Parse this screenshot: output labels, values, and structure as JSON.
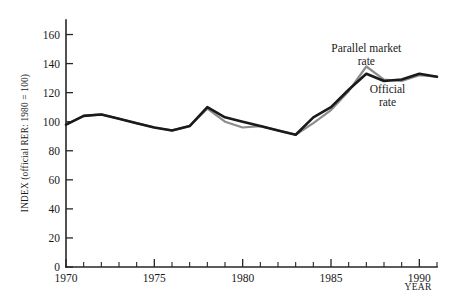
{
  "chart_data": {
    "type": "line",
    "title": "",
    "xlabel": "YEAR",
    "ylabel": "INDEX (official RER: 1980 = 100)",
    "xlim": [
      1970,
      1991
    ],
    "ylim": [
      0,
      170
    ],
    "x_ticks_major": [
      1970,
      1975,
      1980,
      1985,
      1990
    ],
    "x_tick_labels": [
      "1970",
      "1975",
      "1980",
      "1985",
      "1990"
    ],
    "y_ticks": [
      0,
      20,
      40,
      60,
      80,
      100,
      120,
      140,
      160
    ],
    "y_tick_labels": [
      "0",
      "20",
      "40",
      "60",
      "80",
      "100",
      "120",
      "140",
      "160"
    ],
    "grid": false,
    "legend_position": "inline-annotation",
    "x": [
      1970,
      1971,
      1972,
      1973,
      1974,
      1975,
      1976,
      1977,
      1978,
      1979,
      1980,
      1981,
      1982,
      1983,
      1984,
      1985,
      1986,
      1987,
      1988,
      1989,
      1990,
      1991
    ],
    "series": [
      {
        "name": "Official rate",
        "color": "#1a1a1a",
        "values": [
          98,
          104,
          105,
          102,
          99,
          96,
          94,
          97,
          110,
          103,
          100,
          97,
          94,
          91,
          103,
          110,
          122,
          133,
          128,
          129,
          133,
          131
        ]
      },
      {
        "name": "Parallel market rate",
        "color": "#8c8c8c",
        "values": [
          98,
          104,
          105,
          102,
          99,
          96,
          94,
          97,
          109,
          100,
          96,
          97,
          94,
          91,
          99,
          108,
          121,
          138,
          129,
          128,
          132,
          131
        ]
      }
    ],
    "annotations": [
      {
        "name": "parallel-market-rate",
        "line1": "Parallel market",
        "line2": "rate",
        "x": 1987,
        "y": 148
      },
      {
        "name": "official-rate",
        "line1": "Official",
        "line2": "rate",
        "x": 1988.2,
        "y": 120
      }
    ]
  },
  "axes": {
    "y_axis_title": "INDEX (official RER: 1980 = 100)",
    "x_axis_title": "YEAR"
  }
}
